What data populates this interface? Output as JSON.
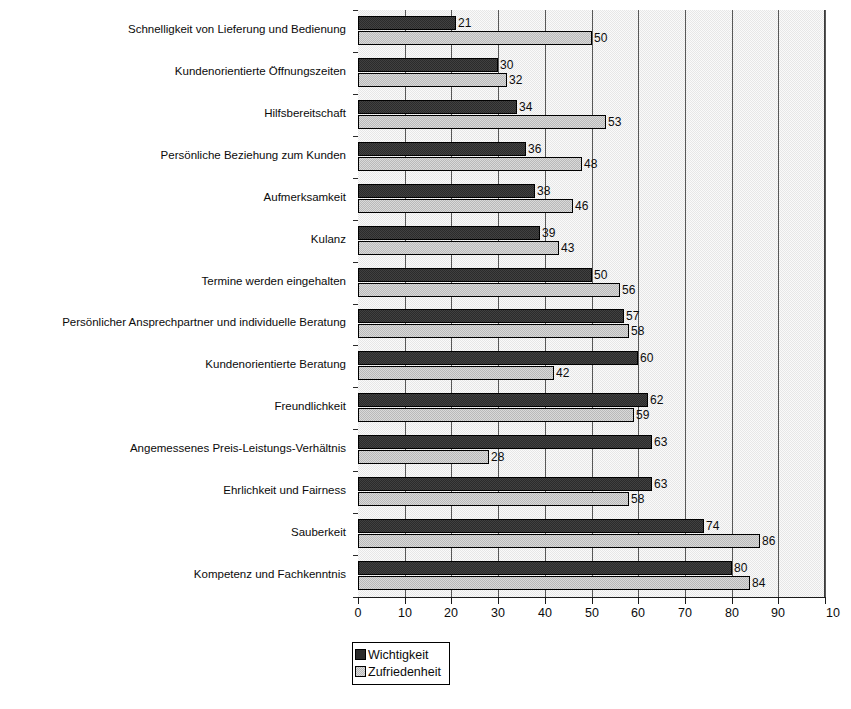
{
  "chart_data": {
    "type": "bar",
    "orientation": "horizontal",
    "title": "",
    "subtitle": "",
    "xlabel": "",
    "ylabel": "",
    "xlim": [
      0,
      100
    ],
    "xticks": [
      0,
      10,
      20,
      30,
      40,
      50,
      60,
      70,
      80,
      90,
      100
    ],
    "xtick_labels": [
      "0",
      "10",
      "20",
      "30",
      "40",
      "50",
      "60",
      "70",
      "80",
      "90",
      "100"
    ],
    "xtick_last_clipped_label": "10",
    "grid": true,
    "grid_axis": "x",
    "legend_position": "bottom-left",
    "categories": [
      "Schnelligkeit von Lieferung und Bedienung",
      "Kundenorientierte Öffnungszeiten",
      "Hilfsbereitschaft",
      "Persönliche Beziehung zum Kunden",
      "Aufmerksamkeit",
      "Kulanz",
      "Termine werden eingehalten",
      "Persönlicher Ansprechpartner und individuelle Beratung",
      "Kundenorientierte Beratung",
      "Freundlichkeit",
      "Angemessenes Preis-Leistungs-Verhältnis",
      "Ehrlichkeit und Fairness",
      "Sauberkeit",
      "Kompetenz und Fachkenntnis"
    ],
    "series": [
      {
        "name": "Wichtigkeit",
        "color": "#2b2b2b",
        "values": [
          21,
          30,
          34,
          36,
          38,
          39,
          50,
          57,
          60,
          62,
          63,
          63,
          74,
          80
        ]
      },
      {
        "name": "Zufriedenheit",
        "color": "#b9b9b9",
        "values": [
          50,
          32,
          53,
          48,
          46,
          43,
          56,
          58,
          42,
          59,
          28,
          58,
          86,
          84
        ]
      }
    ]
  },
  "legend": {
    "items": [
      {
        "label": "Wichtigkeit"
      },
      {
        "label": "Zufriedenheit"
      }
    ]
  },
  "colors": {
    "importance": "#2b2b2b",
    "satisfaction": "#b9b9b9",
    "plot_background": "#e7e7e7",
    "gridline": "#585858",
    "axis": "#1a1a1a",
    "text": "#0b0b0b"
  }
}
